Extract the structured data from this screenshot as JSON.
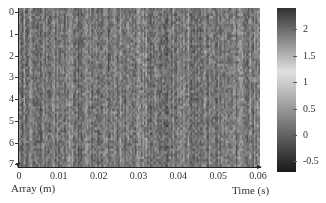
{
  "chart_data": {
    "type": "heatmap",
    "title": "",
    "xlabel": "Time (s)",
    "ylabel": "Array (m)",
    "xlim": [
      0,
      0.06
    ],
    "ylim": [
      0,
      7.3
    ],
    "y_inverted": true,
    "x_ticks": [
      "0",
      "0.01",
      "0.02",
      "0.03",
      "0.04",
      "0.05",
      "0.06"
    ],
    "y_ticks": [
      "0",
      "1",
      "2",
      "3",
      "4",
      "5",
      "6",
      "7"
    ],
    "colorbar": {
      "ticks": [
        "2",
        "1.5",
        "1",
        "0.5",
        "0",
        "-0.5"
      ],
      "range": [
        -0.7,
        2.4
      ],
      "colormap": "grayscale, dark at extremes, light near 1.2"
    },
    "grid": false,
    "legend": "colorbar right"
  },
  "labels": {
    "x_axis": "Time (s)",
    "y_axis": "Array (m)"
  },
  "render": {
    "columns": 160,
    "rows": 60,
    "seed": 17
  }
}
